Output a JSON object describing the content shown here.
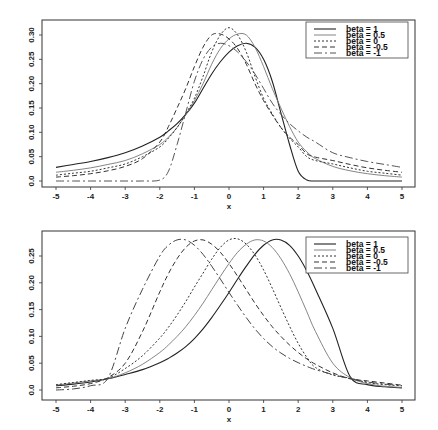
{
  "chart_data": [
    {
      "type": "line",
      "title": "",
      "xlabel": "x",
      "ylabel": "",
      "xlim": [
        -5,
        5
      ],
      "ylim": [
        0,
        0.32
      ],
      "x_ticks": [
        "-5",
        "-4",
        "-3",
        "-2",
        "-1",
        "0",
        "1",
        "2",
        "3",
        "4",
        "5"
      ],
      "y_ticks": [
        "0.0",
        "0.05",
        "0.10",
        "0.15",
        "0.20",
        "0.25",
        "0.30"
      ],
      "grid": false,
      "legend_position": "top-right",
      "legend": [
        "beta =  1",
        "beta =  0.5",
        "beta =  0",
        "beta =  -0.5",
        "beta =  -1"
      ],
      "x": [
        -5,
        -4.5,
        -4,
        -3.5,
        -3,
        -2.5,
        -2,
        -1.75,
        -1.5,
        -1.25,
        -1,
        -0.75,
        -0.5,
        -0.25,
        0,
        0.25,
        0.5,
        0.75,
        1,
        1.25,
        1.5,
        1.75,
        2,
        2.25,
        2.5,
        3,
        3.5,
        4,
        4.5,
        5
      ],
      "series": [
        {
          "name": "beta = 1",
          "dash": "",
          "color": "#222222",
          "width": 1.1,
          "values": [
            0.028,
            0.034,
            0.04,
            0.048,
            0.058,
            0.072,
            0.09,
            0.103,
            0.118,
            0.137,
            0.16,
            0.19,
            0.22,
            0.245,
            0.265,
            0.278,
            0.283,
            0.275,
            0.25,
            0.205,
            0.14,
            0.075,
            0.02,
            0.002,
            0.0,
            0.0,
            0.0,
            0.0,
            0.0,
            0.0
          ]
        },
        {
          "name": "beta = 0.5",
          "dash": "",
          "color": "#777777",
          "width": 0.9,
          "values": [
            0.018,
            0.022,
            0.027,
            0.034,
            0.042,
            0.056,
            0.075,
            0.09,
            0.11,
            0.136,
            0.165,
            0.2,
            0.24,
            0.272,
            0.292,
            0.302,
            0.3,
            0.275,
            0.235,
            0.19,
            0.15,
            0.112,
            0.08,
            0.06,
            0.046,
            0.03,
            0.021,
            0.015,
            0.011,
            0.008
          ]
        },
        {
          "name": "beta = 0",
          "dash": "2,2",
          "color": "#333333",
          "width": 1.0,
          "values": [
            0.012,
            0.016,
            0.02,
            0.027,
            0.035,
            0.05,
            0.07,
            0.088,
            0.11,
            0.138,
            0.17,
            0.215,
            0.265,
            0.3,
            0.315,
            0.3,
            0.265,
            0.215,
            0.17,
            0.138,
            0.11,
            0.088,
            0.07,
            0.05,
            0.042,
            0.035,
            0.027,
            0.02,
            0.016,
            0.012
          ]
        },
        {
          "name": "beta = -0.5",
          "dash": "5,3",
          "color": "#333333",
          "width": 1.0,
          "values": [
            0.008,
            0.011,
            0.015,
            0.021,
            0.03,
            0.046,
            0.08,
            0.112,
            0.15,
            0.19,
            0.235,
            0.275,
            0.3,
            0.302,
            0.292,
            0.272,
            0.24,
            0.2,
            0.165,
            0.136,
            0.11,
            0.09,
            0.075,
            0.056,
            0.049,
            0.042,
            0.034,
            0.027,
            0.022,
            0.018
          ]
        },
        {
          "name": "beta = -1",
          "dash": "8,3,2,3",
          "color": "#555555",
          "width": 1.0,
          "values": [
            0.0,
            0.0,
            0.0,
            0.0,
            0.0,
            0.0,
            0.002,
            0.02,
            0.075,
            0.14,
            0.205,
            0.25,
            0.275,
            0.283,
            0.278,
            0.265,
            0.245,
            0.22,
            0.19,
            0.16,
            0.137,
            0.118,
            0.103,
            0.09,
            0.08,
            0.058,
            0.048,
            0.04,
            0.034,
            0.028
          ]
        }
      ]
    },
    {
      "type": "line",
      "title": "",
      "xlabel": "x",
      "ylabel": "",
      "xlim": [
        -5,
        5
      ],
      "ylim": [
        0,
        0.28
      ],
      "x_ticks": [
        "-5",
        "-4",
        "-3",
        "-2",
        "-1",
        "0",
        "1",
        "2",
        "3",
        "4",
        "5"
      ],
      "y_ticks": [
        "0.0",
        "0.05",
        "0.10",
        "0.15",
        "0.20",
        "0.25"
      ],
      "grid": false,
      "legend_position": "top-right",
      "legend": [
        "beta =  1",
        "beta =  0.5",
        "beta =  0",
        "beta =  -0.5",
        "beta =  -1"
      ],
      "x": [
        -5,
        -4.5,
        -4,
        -3.5,
        -3,
        -2.5,
        -2,
        -1.75,
        -1.5,
        -1.25,
        -1,
        -0.75,
        -0.5,
        -0.25,
        0,
        0.25,
        0.5,
        0.75,
        1,
        1.25,
        1.5,
        1.75,
        2,
        2.25,
        2.5,
        3,
        3.5,
        4,
        4.5,
        5
      ],
      "series": [
        {
          "name": "beta = 1",
          "dash": "",
          "color": "#222222",
          "width": 1.1,
          "values": [
            0.008,
            0.011,
            0.015,
            0.021,
            0.029,
            0.038,
            0.051,
            0.059,
            0.069,
            0.081,
            0.096,
            0.114,
            0.135,
            0.158,
            0.182,
            0.207,
            0.231,
            0.253,
            0.27,
            0.28,
            0.28,
            0.27,
            0.25,
            0.222,
            0.188,
            0.115,
            0.025,
            0.01,
            0.006,
            0.004
          ]
        },
        {
          "name": "beta = 0.5",
          "dash": "",
          "color": "#777777",
          "width": 0.9,
          "values": [
            0.009,
            0.013,
            0.017,
            0.021,
            0.032,
            0.048,
            0.07,
            0.084,
            0.1,
            0.118,
            0.139,
            0.162,
            0.187,
            0.212,
            0.236,
            0.257,
            0.272,
            0.28,
            0.278,
            0.266,
            0.245,
            0.217,
            0.183,
            0.146,
            0.109,
            0.05,
            0.023,
            0.012,
            0.007,
            0.005
          ]
        },
        {
          "name": "beta = 0",
          "dash": "2,2",
          "color": "#333333",
          "width": 1.0,
          "values": [
            0.01,
            0.014,
            0.018,
            0.022,
            0.04,
            0.064,
            0.097,
            0.117,
            0.14,
            0.165,
            0.192,
            0.218,
            0.244,
            0.266,
            0.28,
            0.282,
            0.272,
            0.252,
            0.224,
            0.19,
            0.154,
            0.119,
            0.087,
            0.061,
            0.042,
            0.028,
            0.022,
            0.014,
            0.01,
            0.008
          ]
        },
        {
          "name": "beta = -0.5",
          "dash": "5,3",
          "color": "#333333",
          "width": 1.0,
          "values": [
            0.004,
            0.007,
            0.012,
            0.023,
            0.05,
            0.109,
            0.183,
            0.217,
            0.245,
            0.266,
            0.278,
            0.28,
            0.272,
            0.257,
            0.236,
            0.212,
            0.187,
            0.162,
            0.139,
            0.118,
            0.1,
            0.084,
            0.07,
            0.058,
            0.048,
            0.032,
            0.021,
            0.017,
            0.013,
            0.009
          ]
        },
        {
          "name": "beta = -1",
          "dash": "8,3,2,3",
          "color": "#444444",
          "width": 1.0,
          "values": [
            0.0,
            0.002,
            0.008,
            0.022,
            0.115,
            0.188,
            0.25,
            0.27,
            0.28,
            0.28,
            0.27,
            0.253,
            0.231,
            0.207,
            0.182,
            0.158,
            0.135,
            0.114,
            0.096,
            0.081,
            0.069,
            0.059,
            0.051,
            0.044,
            0.038,
            0.029,
            0.021,
            0.015,
            0.011,
            0.008
          ]
        }
      ]
    }
  ],
  "layout": {
    "panels": [
      {
        "frame": [
          42,
          20,
          415,
          187
        ],
        "x0_px": 56,
        "x1_px": 402,
        "y0_px": 181,
        "yTop_val": 0.3,
        "yTop_px": 35,
        "legend_box": [
          306,
          22,
          408,
          58
        ]
      },
      {
        "frame": [
          42,
          231,
          415,
          400
        ],
        "x0_px": 56,
        "x1_px": 402,
        "y0_px": 390,
        "yTop_val": 0.25,
        "yTop_px": 256,
        "legend_box": [
          306,
          237,
          408,
          273
        ]
      }
    ]
  }
}
